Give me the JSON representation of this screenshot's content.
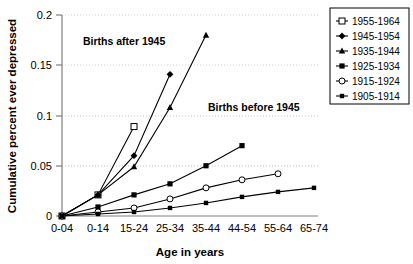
{
  "chart_data": {
    "type": "line",
    "title": "",
    "xlabel": "Age in years",
    "ylabel": "Cumulative percent ever depressed",
    "categories": [
      "0-04",
      "0-14",
      "15-24",
      "25-34",
      "35-44",
      "44-54",
      "55-64",
      "65-74"
    ],
    "ylim": [
      0,
      0.2
    ],
    "yticks": [
      "0",
      "0.05",
      "0.1",
      "0.15",
      "0.2"
    ],
    "ytick_values": [
      0,
      0.05,
      0.1,
      0.15,
      0.2
    ],
    "grid": true,
    "legend_position": "top-right",
    "annotations": [
      {
        "text": "Births after 1945",
        "x_category": "0-14",
        "y_value": 0.172
      },
      {
        "text": "Births before 1945",
        "x_category": "35-44",
        "y_value": 0.095
      }
    ],
    "series": [
      {
        "name": "1955-1964",
        "marker": "open-square",
        "values": [
          0,
          0.021,
          0.089,
          null,
          null,
          null,
          null,
          null
        ]
      },
      {
        "name": "1945-1954",
        "marker": "filled-diamond",
        "values": [
          0,
          0.021,
          0.06,
          0.141,
          null,
          null,
          null,
          null
        ]
      },
      {
        "name": "1935-1944",
        "marker": "filled-triangle",
        "values": [
          0,
          0.021,
          0.049,
          0.108,
          0.18,
          null,
          null,
          null
        ]
      },
      {
        "name": "1925-1934",
        "marker": "filled-square",
        "values": [
          0,
          0.009,
          0.021,
          0.032,
          0.05,
          0.07,
          null,
          null
        ]
      },
      {
        "name": "1915-1924",
        "marker": "open-circle",
        "values": [
          0,
          0.004,
          0.008,
          0.017,
          0.028,
          0.036,
          0.042,
          null
        ]
      },
      {
        "name": "1905-1914",
        "marker": "filled-square-small",
        "values": [
          0,
          0.002,
          0.004,
          0.008,
          0.013,
          0.019,
          0.024,
          0.028
        ]
      }
    ]
  },
  "legend": {
    "entries": [
      {
        "label": "1955-1964"
      },
      {
        "label": "1945-1954"
      },
      {
        "label": "1935-1944"
      },
      {
        "label": "1925-1934"
      },
      {
        "label": "1915-1924"
      },
      {
        "label": "1905-1914"
      }
    ]
  },
  "axes": {
    "y_title": "Cumulative percent ever depressed",
    "x_title": "Age in years",
    "y_ticks": [
      "0.2",
      "0.15",
      "0.1",
      "0.05",
      "0"
    ],
    "x_ticks": [
      "0-04",
      "0-14",
      "15-24",
      "25-34",
      "35-44",
      "44-54",
      "55-64",
      "65-74"
    ]
  },
  "annotations": {
    "after": "Births after 1945",
    "before": "Births before 1945"
  }
}
